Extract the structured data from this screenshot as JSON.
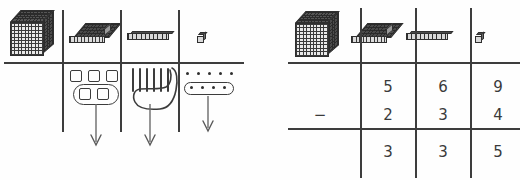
{
  "worksheet": {
    "title": "Base-ten place value subtraction worksheet",
    "operation": "subtraction",
    "minuend": "569",
    "subtrahend": "234",
    "difference": "335",
    "operator_symbol": "−",
    "ink_color": "#3c3c3c",
    "paper_color": "#fefefe"
  },
  "place_value_headers": [
    {
      "name": "thousands",
      "icon": "thousand-cube-icon",
      "value": 1000
    },
    {
      "name": "hundreds",
      "icon": "hundred-flat-icon",
      "value": 100
    },
    {
      "name": "tens",
      "icon": "ten-rod-icon",
      "value": 10
    },
    {
      "name": "ones",
      "icon": "one-unit-icon",
      "value": 1
    }
  ],
  "left_panel": {
    "name": "manipulatives-diagram",
    "columns": [
      {
        "place": "thousands",
        "icon": "thousand-cube-icon",
        "drawn_items": 0,
        "circled_items": 0,
        "has_arrow": false
      },
      {
        "place": "hundreds",
        "icon": "hundred-flat-icon",
        "item_shape": "square",
        "drawn_items": 3,
        "circled_items": 2,
        "has_arrow": true,
        "arrow_direction": "down"
      },
      {
        "place": "tens",
        "icon": "ten-rod-icon",
        "item_shape": "vertical-stroke",
        "drawn_items": 6,
        "circled_items": 3,
        "has_arrow": true,
        "arrow_direction": "down"
      },
      {
        "place": "ones",
        "icon": "one-unit-icon",
        "item_shape": "dot",
        "drawn_items": 5,
        "circled_items": 4,
        "has_arrow": true,
        "arrow_direction": "down"
      }
    ]
  },
  "right_panel": {
    "name": "place-value-table",
    "column_headers": [
      "thousand-cube-icon",
      "hundred-flat-icon",
      "ten-rod-icon",
      "one-unit-icon"
    ],
    "rows": [
      {
        "role": "minuend",
        "operator": "",
        "digits": [
          "",
          "5",
          "6",
          "9"
        ]
      },
      {
        "role": "subtrahend",
        "operator": "−",
        "digits": [
          "",
          "2",
          "3",
          "4"
        ]
      },
      {
        "role": "difference",
        "operator": "",
        "digits": [
          "",
          "3",
          "3",
          "5"
        ]
      }
    ]
  }
}
